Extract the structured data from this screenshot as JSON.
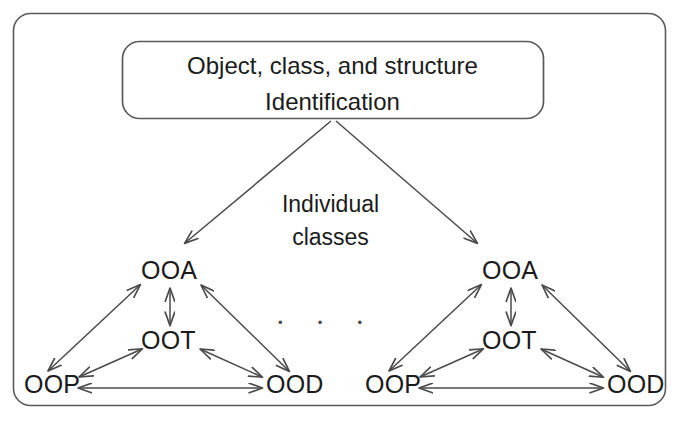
{
  "figure": {
    "title_box": {
      "line1": "Object, class, and structure",
      "line2": "Identification"
    },
    "branch_label": {
      "line1": "Individual",
      "line2": "classes"
    },
    "ellipsis": "•",
    "ellipsis_count": 3,
    "clusters": [
      {
        "name": "left-class-cluster",
        "nodes": {
          "top": "OOA",
          "middle": "OOT",
          "bottom_left": "OOP",
          "bottom_right": "OOD"
        }
      },
      {
        "name": "right-class-cluster",
        "nodes": {
          "top": "OOA",
          "middle": "OOT",
          "bottom_left": "OOP",
          "bottom_right": "OOD"
        }
      }
    ],
    "colors": {
      "stroke": "#4a4a4a",
      "text": "#1b1b1b",
      "background": "#ffffff"
    }
  }
}
